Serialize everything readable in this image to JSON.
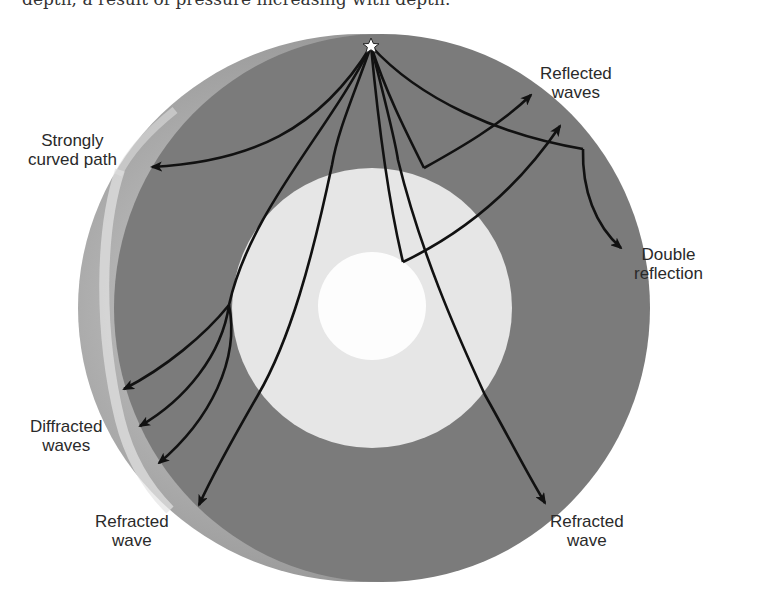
{
  "header": {
    "cut_off_text": "depth, a result of pressure increasing with depth."
  },
  "diagram": {
    "colors": {
      "mantle": "#7b7b7b",
      "outer_core": "#e6e6e6",
      "inner_core": "#fdfdfd",
      "crust_surface": "#a9a9a9",
      "wave_path": "#111111",
      "epicenter_star": "#ffffff"
    },
    "epicenter": {
      "icon": "star-icon",
      "x": 371,
      "y": 46
    },
    "layers": [
      {
        "name": "mantle",
        "cx": 372,
        "cy": 308,
        "r": 272
      },
      {
        "name": "outer_core",
        "cx": 372,
        "cy": 308,
        "r": 140
      },
      {
        "name": "inner_core",
        "cx": 372,
        "cy": 308,
        "r": 54
      }
    ],
    "labels": {
      "strongly_curved": {
        "line1": "Strongly",
        "line2": "curved path"
      },
      "reflected": {
        "line1": "Reflected",
        "line2": "waves"
      },
      "double_reflection": {
        "line1": "Double",
        "line2": "reflection"
      },
      "diffracted": {
        "line1": "Diffracted",
        "line2": "waves"
      },
      "refracted_left": {
        "line1": "Refracted",
        "line2": "wave"
      },
      "refracted_right": {
        "line1": "Refracted",
        "line2": "wave"
      }
    }
  }
}
